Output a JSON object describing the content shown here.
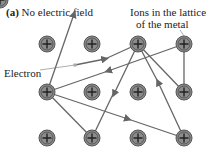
{
  "title": {
    "prefix": "(a)",
    "text": " No electric field"
  },
  "labels": {
    "ions_line1": "Ions in the lattice",
    "ions_line2": "of the metal",
    "electron": "Electron"
  },
  "ion_symbol": "+",
  "colors": {
    "ion_fill": "#8c8c8c",
    "ion_stroke": "#555555",
    "path": "#666666",
    "pointer": "#999999"
  }
}
